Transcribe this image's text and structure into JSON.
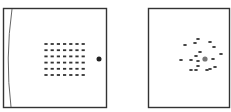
{
  "panels": [
    {
      "name": "ordered-panel",
      "description": "Square frame with curved left boundary, a 7x6 grid of small particles and one large dot on the right",
      "grid": {
        "cols": 7,
        "rows": 6,
        "x0": 46,
        "y0": 44,
        "dx": 6.2,
        "dy": 6.2
      },
      "large_dot": {
        "cx": 99,
        "cy": 59,
        "r": 2.5,
        "color": "#222222"
      }
    },
    {
      "name": "disordered-panel",
      "description": "Square frame with scattered particles around a central gray dot",
      "center_dot": {
        "cx": 205,
        "cy": 59,
        "r": 2.6,
        "color": "#777777"
      },
      "particles": [
        [
          185,
          45
        ],
        [
          195,
          43
        ],
        [
          198,
          39
        ],
        [
          210,
          42
        ],
        [
          214,
          47
        ],
        [
          191,
          60
        ],
        [
          196,
          56
        ],
        [
          198,
          61
        ],
        [
          198,
          66
        ],
        [
          200,
          52
        ],
        [
          181,
          60
        ],
        [
          213,
          59
        ],
        [
          221,
          54
        ],
        [
          191,
          70
        ],
        [
          196,
          70
        ],
        [
          207,
          70
        ],
        [
          210,
          69
        ],
        [
          215,
          67
        ]
      ]
    }
  ],
  "colors": {
    "frame": "#333333",
    "particle": "#333333"
  }
}
